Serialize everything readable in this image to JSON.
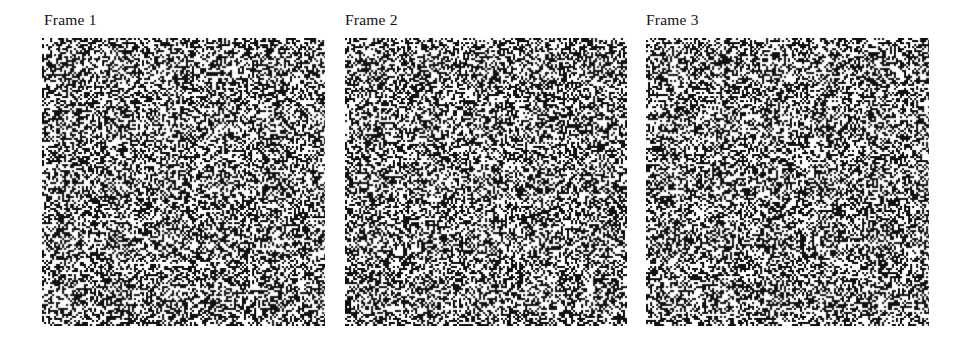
{
  "figure": {
    "background_color": "#ffffff",
    "ink_color": "#111111",
    "width": 960,
    "height": 341,
    "panels": [
      {
        "label": "Frame 1",
        "label_x": 44,
        "label_y": 12,
        "x": 42,
        "y": 38,
        "width": 283,
        "height": 288,
        "noise_seed": 101,
        "black_density": 0.47,
        "cell_size": 2
      },
      {
        "label": "Frame 2",
        "label_x": 345,
        "label_y": 12,
        "x": 345,
        "y": 38,
        "width": 282,
        "height": 288,
        "noise_seed": 202,
        "black_density": 0.47,
        "cell_size": 2
      },
      {
        "label": "Frame 3",
        "label_x": 646,
        "label_y": 12,
        "x": 646,
        "y": 38,
        "width": 283,
        "height": 288,
        "noise_seed": 303,
        "black_density": 0.47,
        "cell_size": 2
      }
    ]
  }
}
